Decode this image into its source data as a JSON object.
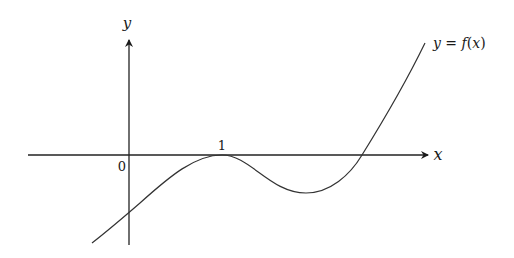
{
  "figure": {
    "type": "function-graph",
    "axes": {
      "x_label": "x",
      "y_label": "y",
      "origin_label": "0"
    },
    "tick_labels": [
      {
        "label": "1",
        "position": "x-axis, local maximum touching x-axis"
      }
    ],
    "curve": {
      "label": "y = f(x)",
      "label_parts": {
        "lhs": "y",
        "eq": " = ",
        "fn": "f",
        "open": "(",
        "arg": "x",
        "close": ")"
      },
      "features": [
        "negative y-intercept",
        "touches x-axis at x = 1 (local maximum)",
        "local minimum below x-axis between x = 1 and second root",
        "crosses x-axis once more and increases"
      ]
    },
    "colors": {
      "axis": "#222222",
      "curve": "#333333",
      "background": "#ffffff"
    }
  }
}
